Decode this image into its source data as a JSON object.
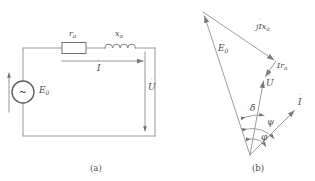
{
  "figure": {
    "stroke_color": "#8a8a8a",
    "text_color": "#4a4a4a",
    "background": "#ffffff"
  },
  "circuit": {
    "caption": "(a)",
    "source": {
      "symbol": "~",
      "label_base": "E",
      "label_sub": "0",
      "label_dot": "˙",
      "label_full": "Ė₀"
    },
    "resistor": {
      "label_base": "r",
      "label_sub": "a",
      "label_full": "rₐ"
    },
    "inductor": {
      "label_base": "x",
      "label_sub": "a",
      "label_full": "xₐ"
    },
    "current": {
      "label_base": "I",
      "label_dot": "˙",
      "label_full": "İ̇"
    },
    "voltage": {
      "label_base": "U",
      "label_dot": "˙",
      "label_full": "U̇"
    }
  },
  "phasor": {
    "caption": "(b)",
    "vectors": [
      {
        "name": "E0",
        "label_base": "E",
        "label_sub": "0",
        "label_dot": "˙"
      },
      {
        "name": "jIxa",
        "prefix": "j",
        "label_base": "I",
        "label_tail": "x",
        "label_sub": "a",
        "label_dot": "˙"
      },
      {
        "name": "Ira",
        "label_base": "I",
        "label_tail": "r",
        "label_sub": "a",
        "label_dot": "˙"
      },
      {
        "name": "U",
        "label_base": "U",
        "label_dot": "˙"
      },
      {
        "name": "I",
        "label_base": "I",
        "label_dot": "˙"
      }
    ],
    "angles": [
      {
        "name": "delta",
        "symbol": "δ"
      },
      {
        "name": "psi",
        "symbol": "ψ"
      },
      {
        "name": "phi",
        "symbol": "φ"
      }
    ]
  }
}
